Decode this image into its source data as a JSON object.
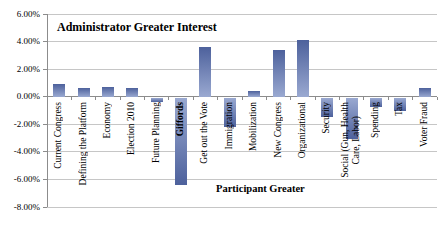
{
  "chart_data": {
    "type": "bar",
    "title": "Administrator Greater Interest",
    "xlabel": "Participant Greater",
    "ylabel": "",
    "units": "percent",
    "categories": [
      "Current Congress",
      "Defining the Platform",
      "Economy",
      "Election 2010",
      "Future Planning",
      "Giffords",
      "Get out the Vote",
      "Immigration",
      "Mobilization",
      "New Congress",
      "Organizational",
      "Security",
      "Social (Gun, Health Care, Labor)",
      "Spending",
      "Tax",
      "Voter Fraud"
    ],
    "values": [
      0.9,
      0.6,
      0.7,
      0.6,
      -0.3,
      -6.3,
      3.6,
      -2.1,
      0.4,
      3.4,
      4.1,
      -1.4,
      -3.0,
      -0.7,
      -1.0,
      0.6
    ],
    "ylim": [
      -8,
      6
    ],
    "yticks": [
      6,
      4,
      2,
      0,
      -2,
      -4,
      -6,
      -8
    ],
    "ytick_labels": [
      "6.00%",
      "4.00%",
      "2.00%",
      "0.00%",
      "-2.00%",
      "-4.00%",
      "-6.00%",
      "-8.00%"
    ],
    "grid": true,
    "legend": false,
    "bold_category": "Giffords",
    "category_wrap": {
      "12": [
        "Social (Gun, Health",
        "Care, Labor)"
      ]
    },
    "colors": {
      "bar_dark": "#4d619c",
      "bar_light": "#9aa9d1",
      "gridline": "#c6c6c6",
      "axis": "#8c8c8c",
      "text": "#000000",
      "background": "#ffffff"
    }
  }
}
